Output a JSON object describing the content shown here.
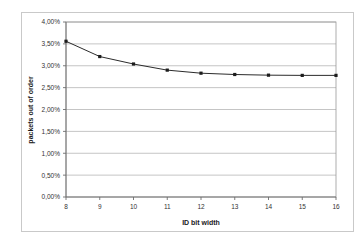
{
  "chart_data": {
    "type": "line",
    "title": "",
    "xlabel": "ID bit width",
    "ylabel": "packets out of order",
    "x": [
      8,
      9,
      10,
      11,
      12,
      13,
      14,
      15,
      16
    ],
    "values": [
      3.56,
      3.21,
      3.04,
      2.9,
      2.83,
      2.8,
      2.785,
      2.78,
      2.78
    ],
    "x_tick_labels": [
      "8",
      "9",
      "10",
      "11",
      "12",
      "13",
      "14",
      "15",
      "16"
    ],
    "y_tick_labels": [
      "0,00%",
      "0,50%",
      "1,00%",
      "1,50%",
      "2,00%",
      "2,50%",
      "3,00%",
      "3,50%",
      "4,00%"
    ],
    "y_tick_values": [
      0.0,
      0.5,
      1.0,
      1.5,
      2.0,
      2.5,
      3.0,
      3.5,
      4.0
    ],
    "xlim": [
      8,
      16
    ],
    "ylim": [
      0,
      4
    ],
    "grid": "horizontal",
    "legend": "none",
    "series": [
      {
        "name": "packets out of order",
        "values": [
          3.56,
          3.21,
          3.04,
          2.9,
          2.83,
          2.8,
          2.785,
          2.78,
          2.78
        ]
      }
    ],
    "colors": {
      "line": "#2b2b2b",
      "marker": "#1c1c1c",
      "grid": "#b6b6b6",
      "axis": "#6e6e6e",
      "background": "#ffffff",
      "border": "#c9c9c9"
    }
  },
  "figure": {
    "background": "#ffffff",
    "border_color": "#c9c9c9"
  }
}
